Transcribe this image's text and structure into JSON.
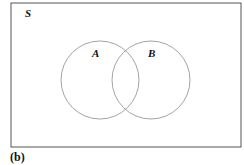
{
  "diagram": {
    "type": "venn",
    "universe": {
      "label": "S",
      "x": 11,
      "y": 3,
      "width": 230,
      "height": 144,
      "stroke": "#555555"
    },
    "sets": [
      {
        "label": "A",
        "cx": 100,
        "cy": 80,
        "r": 39,
        "label_x": 95,
        "label_y": 56,
        "stroke": "#999999"
      },
      {
        "label": "B",
        "cx": 151,
        "cy": 80,
        "r": 39,
        "label_x": 151,
        "label_y": 56,
        "stroke": "#999999"
      }
    ],
    "caption": "(b)"
  }
}
